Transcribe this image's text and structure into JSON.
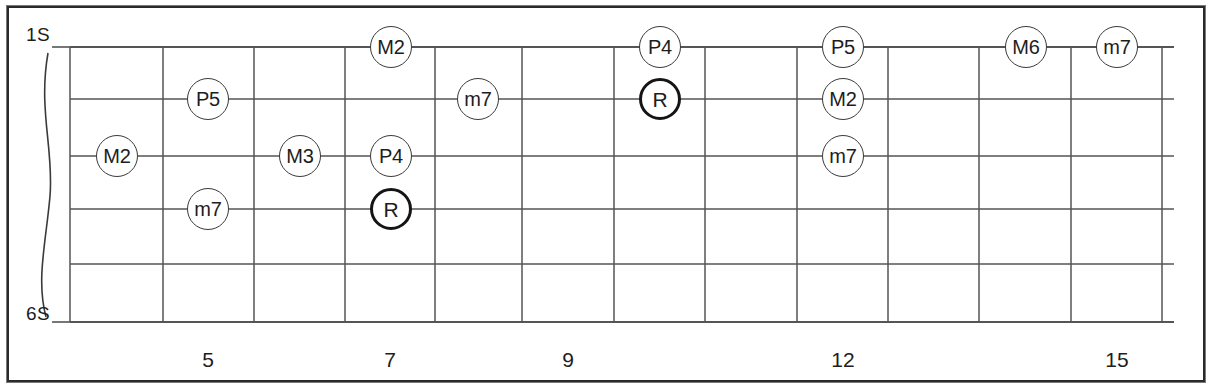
{
  "diagram": {
    "type": "guitar-fretboard",
    "title_text": "",
    "string_labels": {
      "top": "1S",
      "bottom": "6S"
    },
    "string_count": 6,
    "colors": {
      "background": "#ffffff",
      "frame": "#2a2a2a",
      "grid_line": "#555555",
      "marker_border": "#3a3a3a",
      "root_marker_border": "#151515",
      "text": "#1d1d1d"
    },
    "geometry": {
      "frets_x": [
        70,
        163,
        254,
        345,
        435,
        522,
        614,
        705,
        797,
        888,
        979,
        1071,
        1162
      ],
      "strings_y": [
        47,
        99,
        156,
        209,
        264,
        322
      ],
      "marker_radius": 21
    },
    "fret_numbers": [
      {
        "label": "5",
        "x": 208
      },
      {
        "label": "7",
        "x": 390
      },
      {
        "label": "9",
        "x": 568
      },
      {
        "label": "12",
        "x": 843
      },
      {
        "label": "15",
        "x": 1117
      }
    ],
    "markers": [
      {
        "label": "M2",
        "x": 117,
        "y": 156,
        "root": false
      },
      {
        "label": "P5",
        "x": 208,
        "y": 99,
        "root": false
      },
      {
        "label": "m7",
        "x": 208,
        "y": 209,
        "root": false
      },
      {
        "label": "M3",
        "x": 300,
        "y": 156,
        "root": false
      },
      {
        "label": "M2",
        "x": 391,
        "y": 47,
        "root": false
      },
      {
        "label": "P4",
        "x": 391,
        "y": 156,
        "root": false
      },
      {
        "label": "R",
        "x": 391,
        "y": 209,
        "root": true
      },
      {
        "label": "m7",
        "x": 478,
        "y": 99,
        "root": false
      },
      {
        "label": "P4",
        "x": 660,
        "y": 47,
        "root": false
      },
      {
        "label": "R",
        "x": 660,
        "y": 99,
        "root": true
      },
      {
        "label": "P5",
        "x": 843,
        "y": 47,
        "root": false
      },
      {
        "label": "M2",
        "x": 843,
        "y": 99,
        "root": false
      },
      {
        "label": "m7",
        "x": 843,
        "y": 156,
        "root": false
      },
      {
        "label": "M6",
        "x": 1026,
        "y": 47,
        "root": false
      },
      {
        "label": "m7",
        "x": 1117,
        "y": 47,
        "root": false
      }
    ]
  }
}
